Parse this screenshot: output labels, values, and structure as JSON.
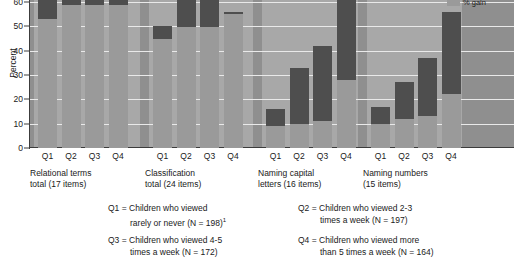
{
  "axis": {
    "ylabel": "Percent",
    "yticks": [
      "60",
      "50",
      "40",
      "30",
      "20",
      "10",
      "0"
    ],
    "ytick_values": [
      60,
      50,
      40,
      30,
      20,
      10,
      0
    ]
  },
  "legend": {
    "label": "% gain",
    "swatch_color": "#9a9a9a"
  },
  "groups": [
    {
      "label_line1": "Relational terms",
      "label_line2": "total (17 items)",
      "ticks": [
        "Q1",
        "Q2",
        "Q3",
        "Q4"
      ]
    },
    {
      "label_line1": "Classification",
      "label_line2": "total (24 items)",
      "ticks": [
        "Q1",
        "Q2",
        "Q3",
        "Q4"
      ]
    },
    {
      "label_line1": "Naming capital",
      "label_line2": "letters (16 items)",
      "ticks": [
        "Q1",
        "Q2",
        "Q3",
        "Q4"
      ]
    },
    {
      "label_line1": "Naming numbers",
      "label_line2": "(15 items)",
      "ticks": [
        "Q1",
        "Q2",
        "Q3",
        "Q4"
      ]
    }
  ],
  "key": [
    {
      "id": "Q1",
      "line1": "Q1 = Children who viewed",
      "line2": "rarely or never (N = 198)",
      "footnote": "1"
    },
    {
      "id": "Q2",
      "line1": "Q2 = Children who viewed 2-3",
      "line2": "times a week (N = 197)",
      "footnote": ""
    },
    {
      "id": "Q3",
      "line1": "Q3 = Children who viewed 4-5",
      "line2": "times a week (N = 172)",
      "footnote": ""
    },
    {
      "id": "Q4",
      "line1": "Q4 = Children who viewed more",
      "line2": "than 5 times a week (N = 164)",
      "footnote": ""
    }
  ],
  "chart_data": {
    "type": "bar",
    "title": "",
    "xlabel": "",
    "ylabel": "Percent",
    "ylim": [
      0,
      60
    ],
    "grid": true,
    "note": "Bars are clipped at the top of the plot area; values above 60 are cut off. Each bar is drawn as a darker upper segment over a lighter lower segment.",
    "categories": [
      "Q1",
      "Q2",
      "Q3",
      "Q4"
    ],
    "group_names": [
      "Relational terms total (17 items)",
      "Classification total (24 items)",
      "Naming capital letters (16 items)",
      "Naming numbers (15 items)"
    ],
    "series": [
      {
        "name": "Relational terms total (17 items)",
        "values": [
          62,
          62,
          62,
          62
        ],
        "segment_top_starts": [
          54,
          60,
          60,
          60
        ],
        "clipped": [
          true,
          true,
          true,
          true
        ]
      },
      {
        "name": "Classification total (24 items)",
        "values": [
          50,
          62,
          62,
          56
        ],
        "segment_top_starts": [
          45,
          51,
          51,
          55
        ],
        "clipped": [
          false,
          true,
          true,
          false
        ]
      },
      {
        "name": "Naming capital letters (16 items)",
        "values": [
          16,
          33,
          42,
          62
        ],
        "segment_top_starts": [
          9,
          10,
          11,
          29
        ],
        "clipped": [
          false,
          false,
          false,
          true
        ]
      },
      {
        "name": "Naming numbers (15 items)",
        "values": [
          17,
          27,
          37,
          56
        ],
        "segment_top_starts": [
          10,
          12,
          13,
          22
        ],
        "clipped": [
          false,
          false,
          false,
          false
        ]
      }
    ]
  }
}
